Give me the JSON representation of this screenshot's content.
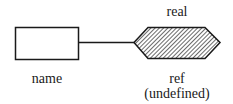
{
  "diagram": {
    "left_node": {
      "label": "name",
      "shape": "rectangle"
    },
    "right_node": {
      "type_label": "real",
      "label": "ref",
      "sublabel": "(undefined)",
      "shape": "hatched-hexagon"
    },
    "connector": {
      "type": "line"
    },
    "colors": {
      "stroke": "#1a1a1a",
      "fill": "#ffffff"
    }
  }
}
